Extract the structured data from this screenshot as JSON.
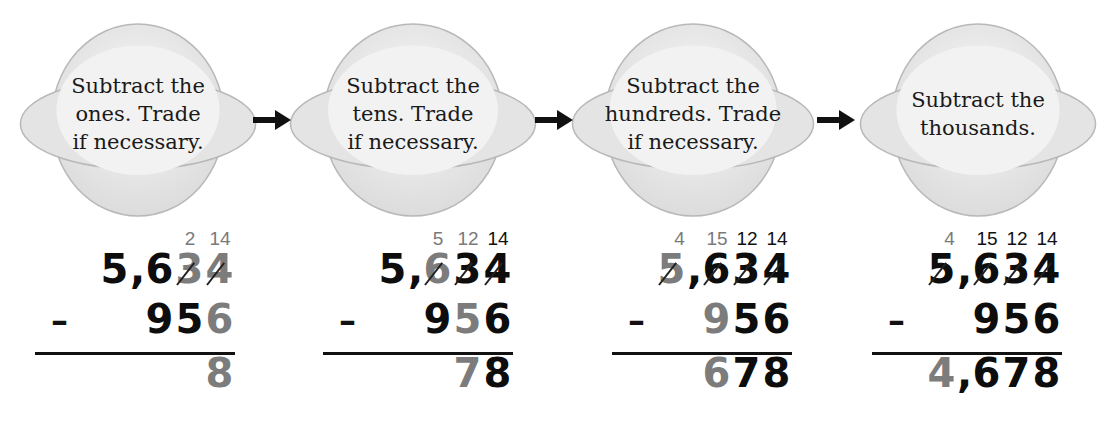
{
  "colors": {
    "text_black": "#0d0d0d",
    "text_gray": "#7c7c7c",
    "bubble_fill": "#ececec",
    "bubble_stroke": "#b8b8b8"
  },
  "steps": [
    {
      "instruction": "Subtract the\nones. Trade\nif necessary.",
      "trades": [
        {
          "text": "",
          "tone": "gray"
        },
        {
          "text": "",
          "tone": "gray"
        },
        {
          "text": "2",
          "tone": "gray"
        },
        {
          "text": "14",
          "tone": "gray"
        }
      ],
      "top": [
        {
          "d": "5",
          "tone": "black",
          "struck": false
        },
        {
          "d": ",",
          "tone": "black",
          "struck": false
        },
        {
          "d": "6",
          "tone": "black",
          "struck": false
        },
        {
          "d": "3",
          "tone": "gray",
          "struck": true
        },
        {
          "d": "4",
          "tone": "gray",
          "struck": true
        }
      ],
      "minus_sign": "–",
      "bottom": [
        {
          "d": "9",
          "tone": "black"
        },
        {
          "d": "5",
          "tone": "black"
        },
        {
          "d": "6",
          "tone": "gray"
        }
      ],
      "answer": [
        {
          "d": "8",
          "tone": "gray"
        }
      ]
    },
    {
      "instruction": "Subtract the\ntens. Trade\nif necessary.",
      "trades": [
        {
          "text": "",
          "tone": "gray"
        },
        {
          "text": "5",
          "tone": "gray"
        },
        {
          "text": "12",
          "tone": "gray"
        },
        {
          "text": "14",
          "tone": "black"
        }
      ],
      "top": [
        {
          "d": "5",
          "tone": "black",
          "struck": false
        },
        {
          "d": ",",
          "tone": "black",
          "struck": false
        },
        {
          "d": "6",
          "tone": "gray",
          "struck": true
        },
        {
          "d": "3",
          "tone": "black",
          "struck": true
        },
        {
          "d": "4",
          "tone": "black",
          "struck": true
        }
      ],
      "minus_sign": "–",
      "bottom": [
        {
          "d": "9",
          "tone": "black"
        },
        {
          "d": "5",
          "tone": "gray"
        },
        {
          "d": "6",
          "tone": "black"
        }
      ],
      "answer": [
        {
          "d": "7",
          "tone": "gray"
        },
        {
          "d": "8",
          "tone": "black"
        }
      ]
    },
    {
      "instruction": "Subtract the\nhundreds. Trade\nif necessary.",
      "trades": [
        {
          "text": "4",
          "tone": "gray"
        },
        {
          "text": "15",
          "tone": "gray"
        },
        {
          "text": "12",
          "tone": "black"
        },
        {
          "text": "14",
          "tone": "black"
        }
      ],
      "top": [
        {
          "d": "5",
          "tone": "gray",
          "struck": true
        },
        {
          "d": ",",
          "tone": "black",
          "struck": false
        },
        {
          "d": "6",
          "tone": "black",
          "struck": true
        },
        {
          "d": "3",
          "tone": "black",
          "struck": true
        },
        {
          "d": "4",
          "tone": "black",
          "struck": true
        }
      ],
      "minus_sign": "–",
      "bottom": [
        {
          "d": "9",
          "tone": "gray"
        },
        {
          "d": "5",
          "tone": "black"
        },
        {
          "d": "6",
          "tone": "black"
        }
      ],
      "answer": [
        {
          "d": "6",
          "tone": "gray"
        },
        {
          "d": "7",
          "tone": "black"
        },
        {
          "d": "8",
          "tone": "black"
        }
      ]
    },
    {
      "instruction": "Subtract the\nthousands.",
      "trades": [
        {
          "text": "4",
          "tone": "gray"
        },
        {
          "text": "15",
          "tone": "black"
        },
        {
          "text": "12",
          "tone": "black"
        },
        {
          "text": "14",
          "tone": "black"
        }
      ],
      "top": [
        {
          "d": "5",
          "tone": "black",
          "struck": true
        },
        {
          "d": ",",
          "tone": "black",
          "struck": false
        },
        {
          "d": "6",
          "tone": "black",
          "struck": true
        },
        {
          "d": "3",
          "tone": "black",
          "struck": true
        },
        {
          "d": "4",
          "tone": "black",
          "struck": true
        }
      ],
      "minus_sign": "–",
      "bottom": [
        {
          "d": "9",
          "tone": "black"
        },
        {
          "d": "5",
          "tone": "black"
        },
        {
          "d": "6",
          "tone": "black"
        }
      ],
      "answer": [
        {
          "d": "4",
          "tone": "gray"
        },
        {
          "d": ",",
          "tone": "black"
        },
        {
          "d": "6",
          "tone": "black"
        },
        {
          "d": "7",
          "tone": "black"
        },
        {
          "d": "8",
          "tone": "black"
        }
      ]
    }
  ]
}
